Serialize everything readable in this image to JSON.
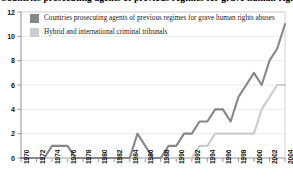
{
  "chart_data": {
    "type": "line",
    "title": "Countries prosecuting agents of previous regimes for grave human rights abuses, 1970-2004",
    "xlabel": "",
    "ylabel": "",
    "ylim": [
      0,
      12
    ],
    "xlim": [
      1970,
      2004
    ],
    "yticks": [
      0,
      2,
      4,
      6,
      8,
      10,
      12
    ],
    "grid": true,
    "legend_position": "top-left",
    "x": [
      1970,
      1971,
      1972,
      1973,
      1974,
      1975,
      1976,
      1977,
      1978,
      1979,
      1980,
      1981,
      1982,
      1983,
      1984,
      1985,
      1986,
      1987,
      1988,
      1989,
      1990,
      1991,
      1992,
      1993,
      1994,
      1995,
      1996,
      1997,
      1998,
      1999,
      2000,
      2001,
      2002,
      2003,
      2004
    ],
    "xtick_labels": [
      "1970",
      "1972",
      "1974",
      "1976",
      "1978",
      "1980",
      "1982",
      "1984",
      "1986",
      "1988",
      "1990",
      "1992",
      "1994",
      "1996",
      "1998",
      "2000",
      "2002",
      "2004"
    ],
    "series": [
      {
        "name": "Countries prosecuting agents of previous regimes for grave human rights abuses",
        "color": "#878787",
        "values": [
          0,
          0,
          0,
          0,
          1,
          1,
          1,
          0,
          0,
          0,
          0,
          0,
          0,
          0,
          0,
          2,
          1,
          0,
          0,
          1,
          1,
          2,
          2,
          3,
          3,
          4,
          4,
          3,
          5,
          6,
          7,
          6,
          8,
          9,
          11
        ]
      },
      {
        "name": "Hybrid and international criminal tribunals",
        "color": "#cccccc",
        "values": [
          0,
          0,
          0,
          0,
          0,
          0,
          0,
          0,
          0,
          0,
          0,
          0,
          0,
          0,
          0,
          0,
          0,
          0,
          0,
          0,
          0,
          0,
          0,
          1,
          1,
          2,
          2,
          2,
          2,
          2,
          2,
          4,
          5,
          6,
          6
        ]
      }
    ]
  },
  "legend": {
    "items": [
      {
        "label": "Countries prosecuting agents of previous regimes for grave human rights abuses",
        "color": "#878787"
      },
      {
        "label": "Hybrid and international criminal tribunals",
        "color": "#cccccc"
      }
    ]
  },
  "axes": {
    "y_tick_labels": [
      "0",
      "2",
      "4",
      "6",
      "8",
      "10",
      "12"
    ]
  }
}
